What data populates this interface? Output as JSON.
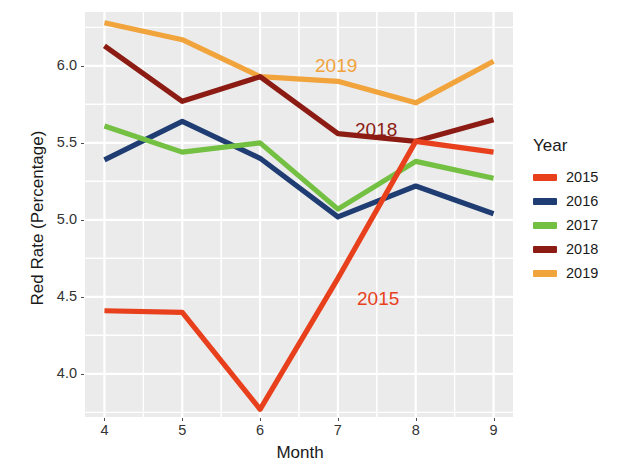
{
  "chart_data": {
    "type": "line",
    "title": "",
    "xlabel": "Month",
    "ylabel": "Red Rate (Percentage)",
    "x": [
      4,
      5,
      6,
      7,
      8,
      9
    ],
    "xtick_labels": [
      "4",
      "5",
      "6",
      "7",
      "8",
      "9"
    ],
    "ytick_labels": [
      "4.0",
      "4.5",
      "5.0",
      "5.5",
      "6.0"
    ],
    "ytick_values": [
      4.0,
      4.5,
      5.0,
      5.5,
      6.0
    ],
    "xlim": [
      3.75,
      9.25
    ],
    "ylim": [
      3.72,
      6.35
    ],
    "grid": true,
    "legend_position": "right",
    "series": [
      {
        "name": "2015",
        "color": "#E8401C",
        "values": [
          4.41,
          4.4,
          3.77,
          4.62,
          5.51,
          5.44
        ]
      },
      {
        "name": "2016",
        "color": "#1F3D73",
        "values": [
          5.39,
          5.64,
          5.4,
          5.02,
          5.22,
          5.04
        ]
      },
      {
        "name": "2017",
        "color": "#74C043",
        "values": [
          5.61,
          5.44,
          5.5,
          5.07,
          5.38,
          5.27
        ]
      },
      {
        "name": "2018",
        "color": "#8C1C13",
        "values": [
          6.13,
          5.77,
          5.93,
          5.56,
          5.51,
          5.65
        ]
      },
      {
        "name": "2019",
        "color": "#F1A33C",
        "values": [
          6.28,
          6.17,
          5.93,
          5.9,
          5.76,
          6.03
        ]
      }
    ],
    "annotations": [
      {
        "text": "2019",
        "series": "2019",
        "color": "#F1A33C",
        "x_px": 315,
        "y_px": 55
      },
      {
        "text": "2018",
        "series": "2018",
        "color": "#8C1C13",
        "x_px": 355,
        "y_px": 119
      },
      {
        "text": "2015",
        "series": "2015",
        "color": "#E8401C",
        "x_px": 357,
        "y_px": 288
      }
    ]
  },
  "axes": {
    "x_title": "Month",
    "y_title": "Red Rate (Percentage)"
  },
  "legend": {
    "title": "Year",
    "items": [
      {
        "label": "2015",
        "color": "#E8401C"
      },
      {
        "label": "2016",
        "color": "#1F3D73"
      },
      {
        "label": "2017",
        "color": "#74C043"
      },
      {
        "label": "2018",
        "color": "#8C1C13"
      },
      {
        "label": "2019",
        "color": "#F1A33C"
      }
    ]
  },
  "panel": {
    "background": "#EBEBEB",
    "gridline_color": "#FFFFFF"
  }
}
